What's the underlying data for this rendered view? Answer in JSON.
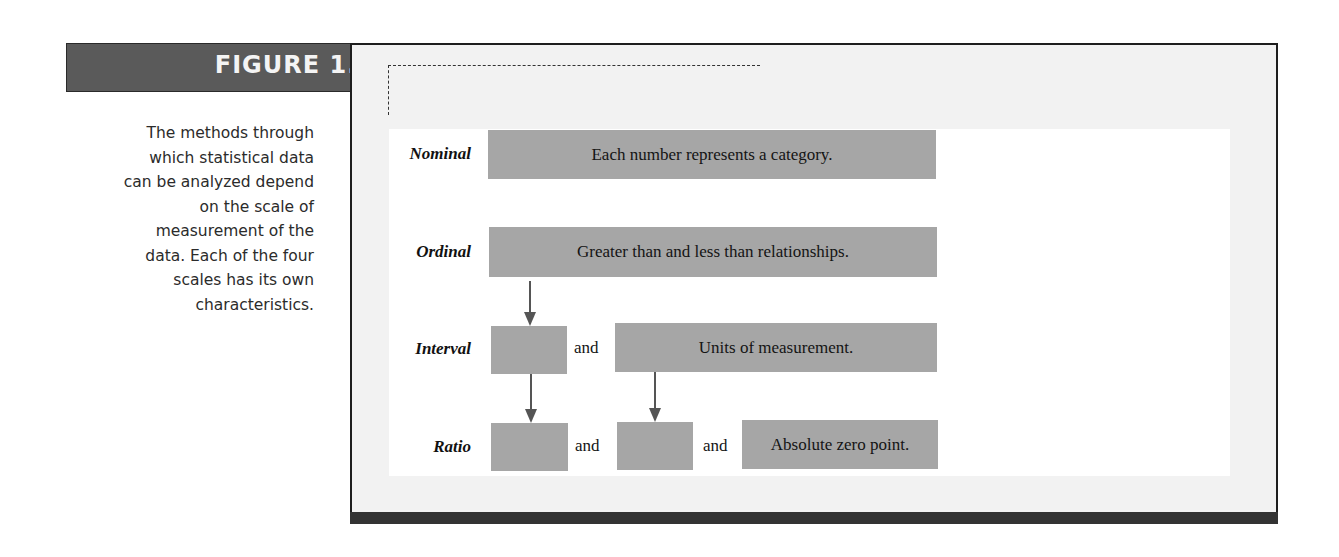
{
  "figure": {
    "title": "FIGURE 1.2",
    "caption_lines": [
      "The methods through",
      "which statistical data",
      "can be analyzed depend",
      "on the scale of",
      "measurement of the",
      "data. Each of the four",
      "scales has its own",
      "characteristics."
    ]
  },
  "diagram": {
    "connector_word": "and",
    "rows": [
      {
        "label": "Nominal",
        "boxes": [
          "Each number represents a category."
        ]
      },
      {
        "label": "Ordinal",
        "boxes": [
          "Greater than and less than relationships."
        ]
      },
      {
        "label": "Interval",
        "boxes": [
          "",
          "Units of measurement."
        ]
      },
      {
        "label": "Ratio",
        "boxes": [
          "",
          "",
          "Absolute zero point."
        ]
      }
    ]
  },
  "colors": {
    "header_bar": "#5a5a5a",
    "box_fill": "#a6a6a6",
    "frame_bg": "#f2f2f2",
    "frame_border": "#1e1e1e",
    "arrow": "#555555"
  }
}
